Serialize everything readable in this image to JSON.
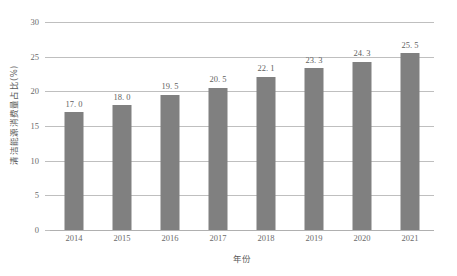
{
  "chart_data": {
    "type": "bar",
    "title": "",
    "subtitle": "",
    "xlabel": "年份",
    "ylabel": "清洁能源消费量占比(%)",
    "categories": [
      "2014",
      "2015",
      "2016",
      "2017",
      "2018",
      "2019",
      "2020",
      "2021"
    ],
    "values": [
      17.0,
      18.0,
      19.5,
      20.5,
      22.1,
      23.3,
      24.3,
      25.5
    ],
    "value_labels": [
      "17. 0",
      "18. 0",
      "19. 5",
      "20. 5",
      "22. 1",
      "23. 3",
      "24. 3",
      "25. 5"
    ],
    "ylim": [
      0,
      30
    ],
    "ytick_values": [
      0,
      5,
      10,
      15,
      20,
      25,
      30
    ],
    "ytick_labels": [
      "0",
      "5",
      "10",
      "15",
      "20",
      "25",
      "30"
    ],
    "grid": true,
    "grid_axis": "y",
    "legend": false,
    "legend_position": "none",
    "series": [
      {
        "name": "清洁能源消费量占比",
        "values": [
          17.0,
          18.0,
          19.5,
          20.5,
          22.1,
          23.3,
          24.3,
          25.5
        ],
        "color": "#808080"
      }
    ],
    "colors": {
      "bar": "#808080",
      "gridline": "#bfbfbf",
      "axis_text": "#6b6b6b",
      "label_text": "#5f5f5f",
      "background": "#ffffff"
    }
  }
}
